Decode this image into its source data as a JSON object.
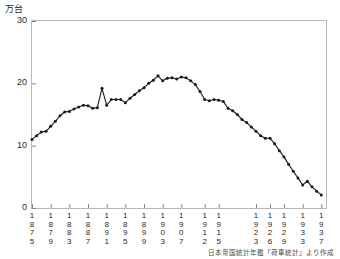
{
  "chart_data": {
    "type": "line",
    "title": "",
    "subtitle": "",
    "ylabel": "万台",
    "xlabel": "",
    "ylim": [
      0,
      30
    ],
    "yticks": [
      0,
      10,
      20,
      30
    ],
    "ytick_labels": [
      "0",
      "10",
      "20",
      "30"
    ],
    "xlim": [
      1875,
      1938
    ],
    "grid": false,
    "legend": null,
    "marker": "filled-circle",
    "line_color": "#1a1a1a",
    "xtick_labels": [
      "1875",
      "1879",
      "1883",
      "1887",
      "1891",
      "1895",
      "1899",
      "1903",
      "1907",
      "1912",
      "1915",
      "1923",
      "1926",
      "1929",
      "1933",
      "1937"
    ],
    "xticks": [
      1875,
      1879,
      1883,
      1887,
      1891,
      1895,
      1899,
      1903,
      1907,
      1912,
      1915,
      1923,
      1926,
      1929,
      1933,
      1937
    ],
    "x": [
      1875,
      1876,
      1877,
      1878,
      1879,
      1880,
      1881,
      1882,
      1883,
      1884,
      1885,
      1886,
      1887,
      1888,
      1889,
      1890,
      1891,
      1892,
      1893,
      1894,
      1895,
      1896,
      1897,
      1898,
      1899,
      1900,
      1901,
      1902,
      1903,
      1904,
      1905,
      1906,
      1907,
      1908,
      1909,
      1910,
      1911,
      1912,
      1913,
      1914,
      1915,
      1916,
      1917,
      1918,
      1919,
      1920,
      1921,
      1922,
      1923,
      1924,
      1925,
      1926,
      1927,
      1928,
      1929,
      1930,
      1931,
      1932,
      1933,
      1934,
      1935,
      1936,
      1937
    ],
    "values": [
      11.0,
      11.6,
      12.2,
      12.3,
      13.1,
      13.9,
      14.8,
      15.4,
      15.5,
      15.9,
      16.2,
      16.5,
      16.4,
      16.0,
      16.1,
      19.2,
      16.5,
      17.4,
      17.4,
      17.4,
      16.9,
      17.6,
      18.2,
      18.8,
      19.3,
      20.0,
      20.5,
      21.2,
      20.4,
      20.8,
      20.9,
      20.7,
      21.0,
      20.9,
      20.4,
      19.8,
      18.7,
      17.4,
      17.2,
      17.4,
      17.3,
      17.1,
      16.0,
      15.6,
      15.0,
      14.2,
      13.7,
      13.0,
      12.3,
      11.6,
      11.2,
      11.2,
      10.3,
      9.2,
      8.2,
      7.0,
      5.9,
      4.8,
      3.7,
      4.3,
      3.4,
      2.7,
      2.1
    ],
    "source_note": "日本帝国統計年鑑「荷車統計」より作成"
  },
  "figure": {
    "unit_label": "万台"
  }
}
